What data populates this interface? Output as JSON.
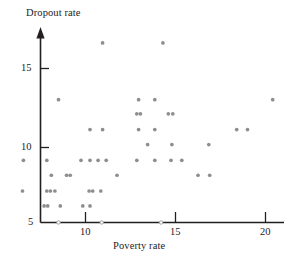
{
  "chart_data": {
    "type": "scatter",
    "title": "",
    "xlabel": "Poverty rate",
    "ylabel": "Dropout rate",
    "xlim": [
      6.1,
      21.0
    ],
    "ylim": [
      5,
      16.9
    ],
    "grid": false,
    "legend": "none",
    "xticks": [
      10,
      15,
      20
    ],
    "xtick_labels": [
      "10",
      "15",
      "20"
    ],
    "yticks": [
      5,
      10,
      15
    ],
    "ytick_labels": [
      "5",
      "10",
      "15"
    ],
    "marker_color": "#8e8e92",
    "axis_color": "#231f20",
    "points": [
      {
        "x": 10.95,
        "y": 16.4
      },
      {
        "x": 14.3,
        "y": 16.4
      },
      {
        "x": 8.5,
        "y": 12.8
      },
      {
        "x": 12.95,
        "y": 12.8
      },
      {
        "x": 13.85,
        "y": 12.8
      },
      {
        "x": 20.4,
        "y": 12.8
      },
      {
        "x": 12.85,
        "y": 11.9
      },
      {
        "x": 13.05,
        "y": 11.9
      },
      {
        "x": 14.6,
        "y": 11.9
      },
      {
        "x": 14.85,
        "y": 11.9
      },
      {
        "x": 10.25,
        "y": 10.9
      },
      {
        "x": 10.95,
        "y": 10.9
      },
      {
        "x": 12.95,
        "y": 10.9
      },
      {
        "x": 13.85,
        "y": 10.9
      },
      {
        "x": 18.4,
        "y": 10.9
      },
      {
        "x": 19.0,
        "y": 10.9
      },
      {
        "x": 13.45,
        "y": 9.95
      },
      {
        "x": 14.8,
        "y": 9.95
      },
      {
        "x": 16.85,
        "y": 9.95
      },
      {
        "x": 6.55,
        "y": 8.95
      },
      {
        "x": 7.85,
        "y": 8.95
      },
      {
        "x": 9.75,
        "y": 8.95
      },
      {
        "x": 10.25,
        "y": 8.95
      },
      {
        "x": 10.7,
        "y": 8.95
      },
      {
        "x": 11.15,
        "y": 8.95
      },
      {
        "x": 12.85,
        "y": 8.95
      },
      {
        "x": 13.85,
        "y": 8.95
      },
      {
        "x": 14.75,
        "y": 8.95
      },
      {
        "x": 15.35,
        "y": 8.95
      },
      {
        "x": 8.1,
        "y": 8.0
      },
      {
        "x": 8.95,
        "y": 8.0
      },
      {
        "x": 9.15,
        "y": 8.0
      },
      {
        "x": 11.75,
        "y": 8.0
      },
      {
        "x": 16.25,
        "y": 8.0
      },
      {
        "x": 16.9,
        "y": 8.0
      },
      {
        "x": 6.5,
        "y": 7.0
      },
      {
        "x": 7.85,
        "y": 7.0
      },
      {
        "x": 8.05,
        "y": 7.0
      },
      {
        "x": 8.3,
        "y": 7.0
      },
      {
        "x": 10.2,
        "y": 7.0
      },
      {
        "x": 10.4,
        "y": 7.0
      },
      {
        "x": 10.85,
        "y": 7.0
      },
      {
        "x": 7.7,
        "y": 6.05
      },
      {
        "x": 7.9,
        "y": 6.05
      },
      {
        "x": 8.6,
        "y": 6.05
      },
      {
        "x": 9.85,
        "y": 6.05
      },
      {
        "x": 10.25,
        "y": 6.05
      },
      {
        "x": 8.5,
        "y": 5.0
      },
      {
        "x": 10.9,
        "y": 5.0
      },
      {
        "x": 14.2,
        "y": 5.0
      }
    ],
    "point_count": 50
  },
  "axes": {
    "y_title": "Dropout rate",
    "x_title": "Poverty rate",
    "x_tick_labels": [
      "10",
      "15",
      "20"
    ],
    "y_tick_labels": [
      "15",
      "10",
      "5"
    ]
  }
}
